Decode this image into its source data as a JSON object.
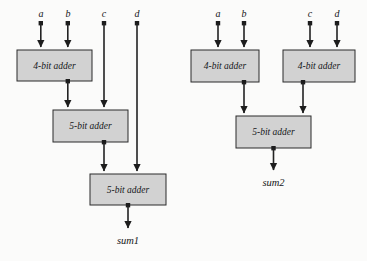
{
  "figure": {
    "title": "",
    "background_color": "#fbfbfa",
    "box_fill_color": "#d2d2d2",
    "box_stroke_color": "#2b2b2b",
    "wire_color": "#232323"
  },
  "groups": [
    {
      "id": "left-circuit",
      "output_label": "sum1",
      "inputs": [
        {
          "label": "a",
          "x": 41
        },
        {
          "label": "b",
          "x": 68
        },
        {
          "label": "c",
          "x": 104
        },
        {
          "label": "d",
          "x": 137
        }
      ],
      "blocks": [
        {
          "id": "left-adder-1",
          "label": "4-bit adder",
          "x": 17,
          "y": 50,
          "w": 75,
          "h": 31
        },
        {
          "id": "left-adder-2",
          "label": "5-bit adder",
          "x": 53,
          "y": 110,
          "w": 75,
          "h": 32
        },
        {
          "id": "left-adder-3",
          "label": "5-bit adder",
          "x": 90,
          "y": 174,
          "w": 76,
          "h": 31
        }
      ]
    },
    {
      "id": "right-circuit",
      "output_label": "sum2",
      "inputs": [
        {
          "label": "a",
          "x": 218
        },
        {
          "label": "b",
          "x": 244
        },
        {
          "label": "c",
          "x": 310
        },
        {
          "label": "d",
          "x": 337
        }
      ],
      "blocks": [
        {
          "id": "right-adder-1",
          "label": "4-bit adder",
          "x": 191,
          "y": 50,
          "w": 68,
          "h": 32
        },
        {
          "id": "right-adder-2",
          "label": "4-bit adder",
          "x": 283,
          "y": 50,
          "w": 72,
          "h": 32
        },
        {
          "id": "right-adder-3",
          "label": "5-bit adder",
          "x": 236,
          "y": 116,
          "w": 75,
          "h": 32
        }
      ]
    }
  ]
}
